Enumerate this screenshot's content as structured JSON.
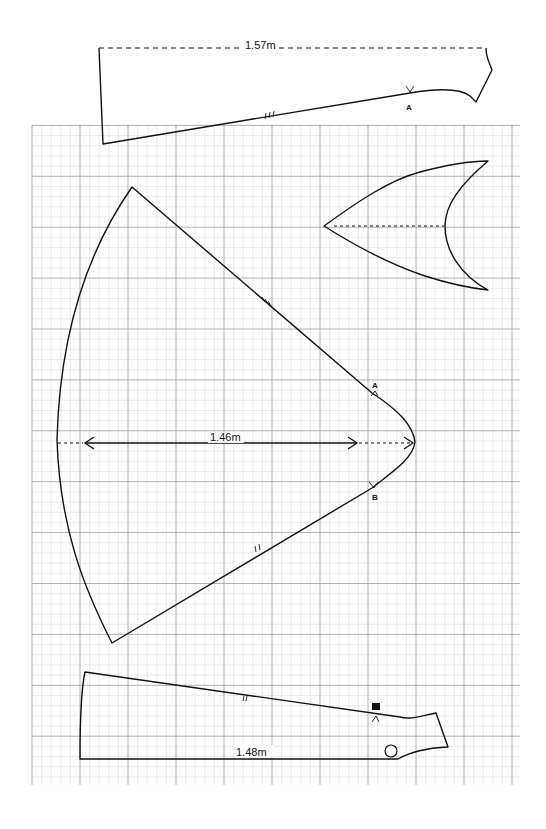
{
  "diagram": {
    "type": "sewing-pattern-pieces",
    "background": "graph-paper",
    "colors": {
      "line": "#111111",
      "grid_major": "#9a9a9a",
      "grid_minor": "#d6d6d6",
      "paper": "#ffffff"
    },
    "pieces": [
      {
        "id": "top-panel",
        "dimension_label": "1.57m",
        "fold_line": "dashed top edge",
        "notch": "III",
        "marker": "A"
      },
      {
        "id": "hood-gusset",
        "center_line": "dashed"
      },
      {
        "id": "wedge-panel",
        "dimension_label": "1.46m",
        "notches": [
          "III",
          "II"
        ],
        "markers": [
          "A",
          "B"
        ]
      },
      {
        "id": "bottom-panel",
        "dimension_label": "1.48m",
        "notch": "II",
        "marker": "B",
        "circle_mark": "O"
      }
    ]
  }
}
